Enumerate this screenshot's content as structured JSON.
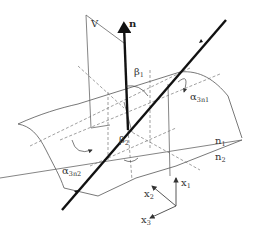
{
  "diagram": {
    "labels": {
      "plane": "V",
      "normal": "n",
      "beta1": "β",
      "beta1_sub": "1",
      "beta2": "β",
      "beta2_sub": "2",
      "alpha1": "α",
      "alpha1_sub": "3n1",
      "alpha2": "α",
      "alpha2_sub": "3n2",
      "medium1": "n",
      "medium1_sub": "1",
      "medium2": "n",
      "medium2_sub": "2",
      "x1": "x",
      "x1_sub": "1",
      "x2": "x",
      "x2_sub": "2",
      "x3": "x",
      "x3_sub": "3"
    },
    "colors": {
      "line": "#555555",
      "thick": "#111111",
      "dashed": "#777777"
    }
  }
}
